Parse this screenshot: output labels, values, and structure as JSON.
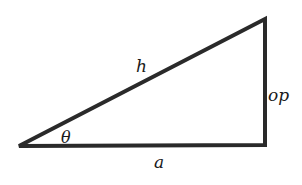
{
  "diagram": {
    "type": "right-triangle",
    "labels": {
      "hypotenuse": "h",
      "opposite": "op",
      "adjacent": "a",
      "angle": "θ"
    },
    "vertices": {
      "angle_vertex": [
        19,
        146
      ],
      "top_right": [
        265,
        19
      ],
      "right_angle": [
        265,
        145
      ]
    },
    "stroke_color": "#2a2a2a",
    "background": "#ffffff"
  }
}
